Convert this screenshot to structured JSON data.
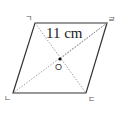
{
  "figure": {
    "shape": "rhombus",
    "vertices": {
      "top_left": {
        "label": "ㄱ",
        "x": 35,
        "y": 23
      },
      "top_right": {
        "label": "ㄹ",
        "x": 107,
        "y": 23
      },
      "bottom_right": {
        "label": "ㄷ",
        "x": 86,
        "y": 93
      },
      "bottom_left": {
        "label": "ㄴ",
        "x": 13,
        "y": 93
      }
    },
    "center": {
      "label": "O",
      "x": 60,
      "y": 59
    },
    "measurement": {
      "label": "11 cm",
      "side": "top (ㄱ–ㄹ)"
    },
    "colors": {
      "edge": "#333333",
      "dash": "#777777",
      "text": "#222222"
    }
  }
}
